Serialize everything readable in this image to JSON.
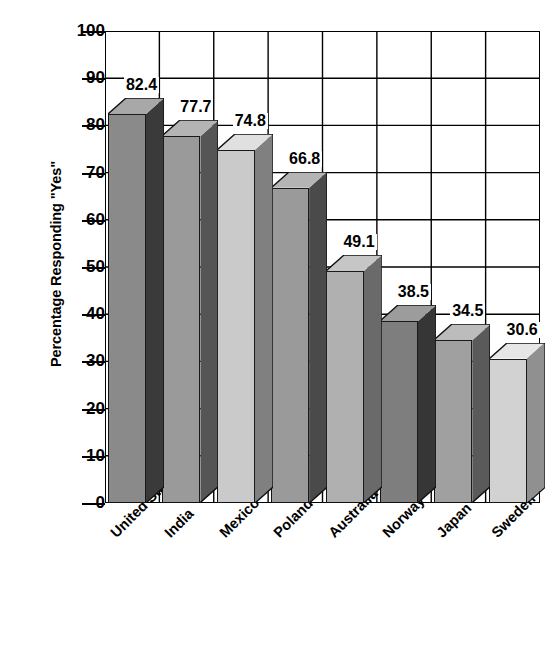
{
  "chart_data": {
    "type": "bar",
    "title": "",
    "subtitle": "",
    "xlabel": "",
    "ylabel": "Percentage Responding \"Yes\"",
    "categories": [
      "United States",
      "India",
      "Mexico",
      "Poland",
      "Australia",
      "Norway",
      "Japan",
      "Sweden"
    ],
    "values": [
      82.4,
      77.7,
      74.8,
      66.8,
      49.1,
      38.5,
      34.5,
      30.6
    ],
    "value_labels": [
      "82.4",
      "77.7",
      "74.8",
      "66.8",
      "49.1",
      "38.5",
      "34.5",
      "30.6"
    ],
    "ylim": [
      0,
      100
    ],
    "ytick_labels": [
      "100",
      "90",
      "80",
      "70",
      "60",
      "50",
      "40",
      "30",
      "20",
      "10",
      "0"
    ],
    "ytick_values": [
      100,
      90,
      80,
      70,
      60,
      50,
      40,
      30,
      20,
      10,
      0
    ],
    "grid": "horizontal-and-vertical",
    "legend": "none",
    "style": "3d-bar",
    "bar_colors": [
      "#8a8a8a",
      "#9a9a9a",
      "#cacaca",
      "#9a9a9a",
      "#b0b0b0",
      "#7e7e7e",
      "#a0a0a0",
      "#d2d2d2"
    ],
    "bar_side_colors": [
      "#3a3a3a",
      "#555555",
      "#808080",
      "#4a4a4a",
      "#6a6a6a",
      "#363636",
      "#5a5a5a",
      "#909090"
    ],
    "bar_top_colors": [
      "#a8a8a8",
      "#b4b4b4",
      "#e0e0e0",
      "#b4b4b4",
      "#c6c6c6",
      "#9c9c9c",
      "#bcbcbc",
      "#e6e6e6"
    ],
    "axis_color": "#000000",
    "grid_color": "#000000",
    "background_color": "#ffffff"
  },
  "axes": {
    "y_title": "Percentage Responding \"Yes\""
  }
}
